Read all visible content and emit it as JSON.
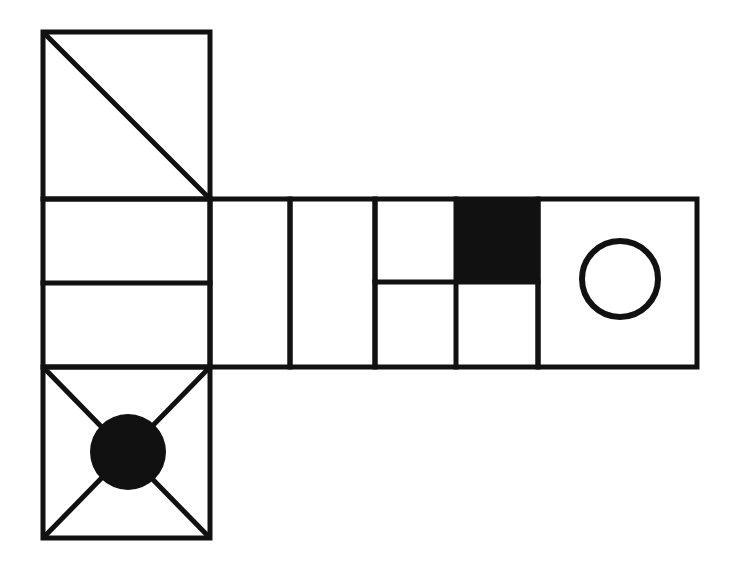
{
  "page": {
    "background_color": "#ffffff",
    "stroke_color": "#111111",
    "fill_color": "#111111",
    "canvas": {
      "width": 730,
      "height": 575
    }
  },
  "figure": {
    "name": "shape-grid-figure",
    "stroke_width": 5,
    "geometry": {
      "left_column": {
        "x_left": 43,
        "x_right": 210,
        "width": 167
      },
      "row_band": {
        "y_top": 199,
        "y_bottom": 367,
        "height": 168
      },
      "row_right_edge": 697
    },
    "cells": [
      {
        "id": "cell-top-left-diagonal",
        "name": "square-with-diagonal",
        "x": 43,
        "y": 32,
        "w": 167,
        "h": 167,
        "contents": "diagonal-top-left-to-bottom-right",
        "fill": "none"
      },
      {
        "id": "cell-middle-left-split",
        "name": "square-split-horizontally",
        "x": 43,
        "y": 199,
        "w": 167,
        "h": 168,
        "contents": "horizontal-divider-at-midheight",
        "divider_y": 283,
        "fill": "none"
      },
      {
        "id": "cell-bottom-left-x-circle",
        "name": "square-with-x-and-filled-circle",
        "x": 43,
        "y": 367,
        "w": 167,
        "h": 171,
        "contents": "both-diagonals-plus-filled-circle",
        "circle": {
          "cx": 128,
          "cy": 452,
          "r": 38,
          "fill": "#111111"
        },
        "fill": "none"
      },
      {
        "id": "cell-row-1-blank",
        "name": "blank-rectangle-one",
        "x": 210,
        "y": 199,
        "w": 80,
        "h": 168,
        "contents": "empty",
        "fill": "none"
      },
      {
        "id": "cell-row-2-blank",
        "name": "blank-rectangle-two",
        "x": 290,
        "y": 199,
        "w": 85,
        "h": 168,
        "contents": "empty",
        "fill": "none"
      },
      {
        "id": "cell-row-3-quad-grid",
        "name": "quadrant-grid-with-black-square",
        "x": 375,
        "y": 199,
        "w": 163,
        "h": 168,
        "contents": "two-by-two-grid-top-right-filled",
        "divider_x": 456,
        "divider_y": 282,
        "filled_quadrant": "top-right",
        "filled_rect": {
          "x": 456,
          "y": 199,
          "w": 82,
          "h": 83,
          "fill": "#111111"
        },
        "fill": "none"
      },
      {
        "id": "cell-row-4-open-circle",
        "name": "square-with-open-circle",
        "x": 538,
        "y": 199,
        "w": 159,
        "h": 168,
        "contents": "unfilled-circle-outline",
        "circle": {
          "cx": 620,
          "cy": 279,
          "r": 38,
          "fill": "none",
          "stroke_width": 6
        },
        "fill": "none"
      }
    ],
    "strokes": [
      {
        "name": "diagonal-line-top-square",
        "x1": 45,
        "y1": 34,
        "x2": 208,
        "y2": 197
      },
      {
        "name": "divider-line-middle-square",
        "x1": 43,
        "y1": 283,
        "x2": 210,
        "y2": 283
      },
      {
        "name": "diagonal-line-bottom-square-tl-br",
        "x1": 45,
        "y1": 369,
        "x2": 208,
        "y2": 536
      },
      {
        "name": "diagonal-line-bottom-square-tr-bl",
        "x1": 208,
        "y1": 369,
        "x2": 45,
        "y2": 536
      },
      {
        "name": "divider-line-quad-grid-vertical",
        "x1": 456,
        "y1": 199,
        "x2": 456,
        "y2": 367
      },
      {
        "name": "divider-line-quad-grid-horizontal",
        "x1": 375,
        "y1": 282,
        "x2": 538,
        "y2": 282
      }
    ]
  }
}
